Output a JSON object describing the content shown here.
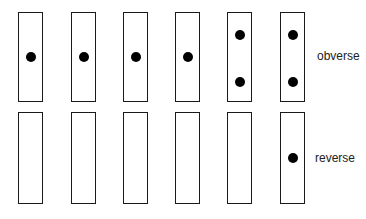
{
  "labels": {
    "top_row": "obverse",
    "bottom_row": "reverse"
  },
  "caption": "Figure 4.10   The bars",
  "cards": [
    {
      "obverse_dots": [
        "middle"
      ],
      "reverse_dots": []
    },
    {
      "obverse_dots": [
        "middle"
      ],
      "reverse_dots": []
    },
    {
      "obverse_dots": [
        "middle"
      ],
      "reverse_dots": []
    },
    {
      "obverse_dots": [
        "middle"
      ],
      "reverse_dots": []
    },
    {
      "obverse_dots": [
        "upper",
        "lower"
      ],
      "reverse_dots": []
    },
    {
      "obverse_dots": [
        "upper",
        "lower"
      ],
      "reverse_dots": [
        "middle"
      ]
    }
  ]
}
